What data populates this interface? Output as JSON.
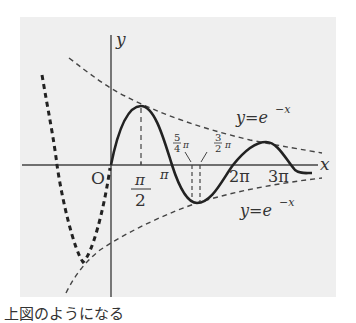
{
  "figure": {
    "background_color": "#efefef",
    "axis_color": "#444444",
    "curve_color": "#222222",
    "axes": {
      "x_label": "x",
      "y_label": "y",
      "origin_label": "O"
    },
    "ticks": {
      "half_pi_num": "π",
      "half_pi_den": "2",
      "pi": "π",
      "two_pi": "2π",
      "three_pi": "3π"
    },
    "annotations": {
      "five_quarter_num": "5",
      "five_quarter_den": "4",
      "five_quarter_pi": "π",
      "three_half_num": "3",
      "three_half_den": "2",
      "three_half_pi": "π"
    },
    "envelope_upper_label": "y=e",
    "envelope_upper_exp": "−x",
    "envelope_lower_label": "y=e",
    "envelope_lower_exp": "−x"
  },
  "caption": "上図のようになる"
}
